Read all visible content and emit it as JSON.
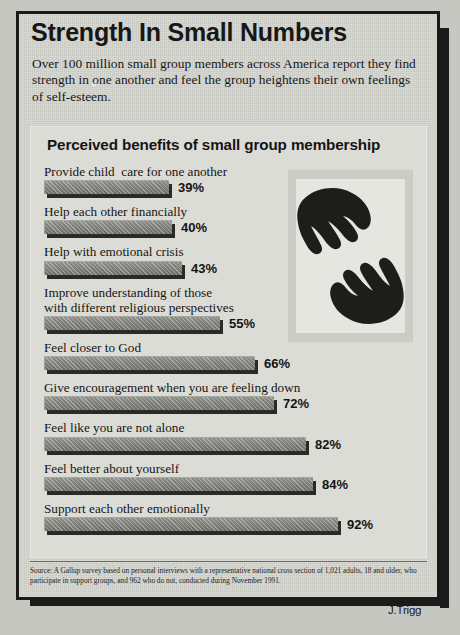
{
  "headline": "Strength In Small Numbers",
  "intro": "Over 100 million small group members across America report they find strength in one another and feel the group heightens their own feelings of self-esteem.",
  "chart_title": "Perceived benefits of small group membership",
  "illustration": {
    "name": "two-hands-reaching-icon",
    "description": "Two dark silhouetted hands reaching toward one another"
  },
  "source_note": "Source: A Gallup survey based on personal interviews with a representative national cross section of 1,021 adults, 18 and older, who participate in support groups, and 962 who do not, conducted during November 1991.",
  "credit": "J.Trigg",
  "colors": {
    "paper": "#d7d7d2",
    "panel": "#dcdcd7",
    "bar": "#7b7b76",
    "bar_shadow": "#2a2a28",
    "frame": "#1a1a18",
    "text": "#171716"
  },
  "chart_data": {
    "type": "bar",
    "orientation": "horizontal",
    "title": "Perceived benefits of small group membership",
    "xlabel": "",
    "ylabel": "",
    "xlim": [
      0,
      100
    ],
    "grid": false,
    "legend": false,
    "value_suffix": "%",
    "categories": [
      "Provide child  care for one another",
      "Help each other financially",
      "Help with emotional crisis",
      "Improve understanding of those\nwith different religious perspectives",
      "Feel closer to God",
      "Give encouragement when you are feeling down",
      "Feel like you are not alone",
      "Feel better about yourself",
      "Support each other emotionally"
    ],
    "values": [
      39,
      40,
      43,
      55,
      66,
      72,
      82,
      84,
      92
    ],
    "value_labels": [
      "39%",
      "40%",
      "43%",
      "55%",
      "66%",
      "72%",
      "82%",
      "84%",
      "92%"
    ]
  }
}
